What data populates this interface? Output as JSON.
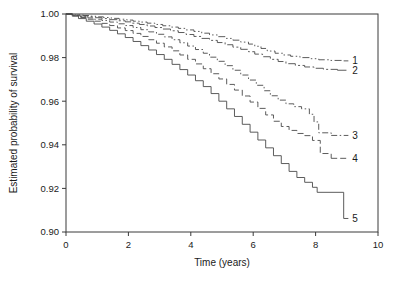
{
  "chart_data": {
    "type": "line",
    "title": "",
    "subtitle": "",
    "xlabel": "Time (years)",
    "ylabel": "Estimated probability of survival",
    "xlim": [
      0,
      10
    ],
    "ylim": [
      0.9,
      1.0
    ],
    "xticks": [
      0,
      2,
      4,
      6,
      8,
      10
    ],
    "xticklabels": [
      "0",
      "2",
      "4",
      "6",
      "8",
      "10"
    ],
    "yticks": [
      0.9,
      0.92,
      0.94,
      0.96,
      0.98,
      1.0
    ],
    "yticklabels": [
      "0.90",
      "0.92",
      "0.94",
      "0.96",
      "0.98",
      "1.00"
    ],
    "grid": false,
    "legend": "inline-right-end-labels",
    "step_type": "post",
    "series": [
      {
        "name": "1",
        "label": "1",
        "linestyle": "dashdotdot",
        "color": "#4a4a4a",
        "end_label_x": 9.05,
        "end_label_y": 0.9785,
        "x": [
          0.0,
          0.25,
          0.55,
          0.75,
          0.95,
          1.2,
          1.45,
          1.7,
          1.95,
          2.15,
          2.35,
          2.6,
          2.85,
          3.1,
          3.35,
          3.6,
          3.85,
          4.1,
          4.35,
          4.6,
          4.85,
          5.1,
          5.35,
          5.6,
          5.85,
          6.05,
          6.25,
          6.45,
          6.7,
          6.95,
          7.2,
          7.5,
          7.8,
          8.1,
          8.45,
          8.9
        ],
        "y": [
          1.0,
          0.9996,
          0.9993,
          0.999,
          0.9987,
          0.9984,
          0.998,
          0.9976,
          0.9972,
          0.9967,
          0.9963,
          0.9958,
          0.9952,
          0.9946,
          0.994,
          0.9934,
          0.9927,
          0.992,
          0.9912,
          0.9904,
          0.9896,
          0.9888,
          0.988,
          0.9871,
          0.9862,
          0.9852,
          0.9842,
          0.983,
          0.982,
          0.9812,
          0.9806,
          0.98,
          0.9795,
          0.979,
          0.9787,
          0.9785
        ]
      },
      {
        "name": "2",
        "label": "2",
        "linestyle": "dashdot",
        "color": "#4a4a4a",
        "end_label_x": 9.05,
        "end_label_y": 0.9742,
        "x": [
          0.0,
          0.2,
          0.45,
          0.7,
          0.95,
          1.15,
          1.4,
          1.65,
          1.9,
          2.1,
          2.35,
          2.6,
          2.85,
          3.1,
          3.35,
          3.6,
          3.85,
          4.1,
          4.35,
          4.6,
          4.85,
          5.1,
          5.35,
          5.6,
          5.85,
          6.05,
          6.3,
          6.55,
          6.8,
          7.05,
          7.35,
          7.65,
          7.95,
          8.25,
          8.7
        ],
        "y": [
          1.0,
          0.9995,
          0.9991,
          0.9987,
          0.9983,
          0.9979,
          0.9974,
          0.9969,
          0.9964,
          0.9958,
          0.9952,
          0.9945,
          0.9938,
          0.9931,
          0.9923,
          0.9915,
          0.9906,
          0.9897,
          0.9888,
          0.9879,
          0.9869,
          0.9859,
          0.9848,
          0.9838,
          0.9827,
          0.9816,
          0.9804,
          0.9792,
          0.9782,
          0.9772,
          0.9764,
          0.9757,
          0.9751,
          0.9746,
          0.9742
        ]
      },
      {
        "name": "3",
        "label": "3",
        "linestyle": "dashdot-short",
        "color": "#4a4a4a",
        "end_label_x": 9.05,
        "end_label_y": 0.9443,
        "x": [
          0.0,
          0.2,
          0.45,
          0.7,
          0.9,
          1.15,
          1.4,
          1.65,
          1.9,
          2.15,
          2.4,
          2.65,
          2.9,
          3.15,
          3.4,
          3.65,
          3.9,
          4.15,
          4.4,
          4.6,
          4.85,
          5.1,
          5.35,
          5.6,
          5.85,
          6.1,
          6.35,
          6.55,
          6.8,
          7.05,
          7.3,
          7.55,
          7.8,
          7.95,
          8.1,
          8.5
        ],
        "y": [
          1.0,
          0.9994,
          0.9988,
          0.9982,
          0.9976,
          0.997,
          0.9963,
          0.9955,
          0.9947,
          0.9938,
          0.9928,
          0.9918,
          0.9907,
          0.9895,
          0.9882,
          0.9868,
          0.9853,
          0.9837,
          0.982,
          0.9802,
          0.9783,
          0.9763,
          0.9742,
          0.972,
          0.9697,
          0.9673,
          0.9648,
          0.9625,
          0.9605,
          0.9588,
          0.9575,
          0.9565,
          0.954,
          0.9505,
          0.9455,
          0.9443
        ]
      },
      {
        "name": "4",
        "label": "4",
        "linestyle": "dashed",
        "color": "#4a4a4a",
        "end_label_x": 9.05,
        "end_label_y": 0.9338,
        "x": [
          0.0,
          0.2,
          0.4,
          0.65,
          0.9,
          1.15,
          1.4,
          1.65,
          1.9,
          2.15,
          2.4,
          2.65,
          2.9,
          3.15,
          3.4,
          3.65,
          3.9,
          4.15,
          4.4,
          4.65,
          4.9,
          5.15,
          5.4,
          5.65,
          5.9,
          6.15,
          6.4,
          6.65,
          6.9,
          7.15,
          7.4,
          7.65,
          7.9,
          8.15,
          8.5
        ],
        "y": [
          1.0,
          0.9992,
          0.9984,
          0.9976,
          0.9967,
          0.9957,
          0.9947,
          0.9936,
          0.9924,
          0.9911,
          0.9897,
          0.9882,
          0.9866,
          0.9849,
          0.9831,
          0.9812,
          0.9792,
          0.9771,
          0.9749,
          0.9726,
          0.9702,
          0.9677,
          0.9651,
          0.9624,
          0.9596,
          0.9567,
          0.9537,
          0.9508,
          0.9484,
          0.9466,
          0.9452,
          0.9442,
          0.942,
          0.936,
          0.9338
        ]
      },
      {
        "name": "5",
        "label": "5",
        "linestyle": "solid",
        "color": "#4a4a4a",
        "end_label_x": 9.05,
        "end_label_y": 0.9062,
        "x": [
          0.0,
          0.2,
          0.4,
          0.65,
          0.9,
          1.15,
          1.4,
          1.65,
          1.9,
          2.15,
          2.4,
          2.65,
          2.9,
          3.15,
          3.4,
          3.65,
          3.9,
          4.15,
          4.4,
          4.65,
          4.9,
          5.15,
          5.4,
          5.65,
          5.9,
          6.15,
          6.4,
          6.65,
          6.9,
          7.15,
          7.4,
          7.65,
          7.9,
          8.05,
          8.75,
          8.9
        ],
        "y": [
          1.0,
          0.999,
          0.9979,
          0.9967,
          0.9954,
          0.994,
          0.9925,
          0.9909,
          0.9892,
          0.9874,
          0.9855,
          0.9835,
          0.9814,
          0.9792,
          0.9769,
          0.9745,
          0.972,
          0.9694,
          0.9667,
          0.9635,
          0.96,
          0.9565,
          0.953,
          0.9494,
          0.9458,
          0.9422,
          0.9386,
          0.935,
          0.9314,
          0.9278,
          0.925,
          0.9228,
          0.9205,
          0.9182,
          0.9182,
          0.9062
        ]
      }
    ]
  },
  "figure": {
    "plot_area": {
      "left": 66,
      "top": 14,
      "right": 378,
      "bottom": 232
    },
    "background_color": "#ffffff",
    "frame_color": "#3a3a3a",
    "line_color": "#4a4a4a"
  }
}
